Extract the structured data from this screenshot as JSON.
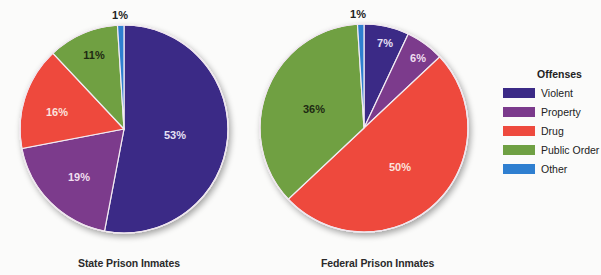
{
  "chart_data": [
    {
      "type": "pie",
      "title": "State Prison Inmates",
      "categories": [
        "Violent",
        "Property",
        "Drug",
        "Public Order",
        "Other"
      ],
      "values": [
        53,
        19,
        16,
        11,
        1
      ],
      "labels": [
        "53%",
        "19%",
        "16%",
        "11%",
        "1%"
      ],
      "start_angle": "12 o'clock, clockwise",
      "legend_position": "right"
    },
    {
      "type": "pie",
      "title": "Federal Prison Inmates",
      "categories": [
        "Violent",
        "Property",
        "Drug",
        "Public Order",
        "Other"
      ],
      "values": [
        7,
        6,
        50,
        36,
        1
      ],
      "labels": [
        "7%",
        "6%",
        "50%",
        "36%",
        "1%"
      ],
      "start_angle": "12 o'clock, clockwise",
      "legend_position": "right"
    }
  ],
  "legend": {
    "title": "Offenses",
    "items": [
      {
        "label": "Violent",
        "color": "#3b2a86"
      },
      {
        "label": "Property",
        "color": "#7b3a8c"
      },
      {
        "label": "Drug",
        "color": "#ee4a3e"
      },
      {
        "label": "Public Order",
        "color": "#6fa043"
      },
      {
        "label": "Other",
        "color": "#2f7fd0"
      }
    ]
  },
  "captions": {
    "state": "State Prison Inmates",
    "federal": "Federal Prison Inmates"
  },
  "label_colors": {
    "Violent": "#e6e0f5",
    "Property": "#f0dff0",
    "Drug": "#fbe3dd",
    "Public Order": "#1e2a12",
    "Other": "#222222"
  }
}
